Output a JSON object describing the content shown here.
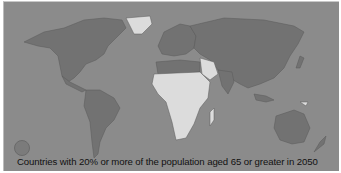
{
  "map": {
    "title": "Countries with 20% or more of the population aged 65 or greater in 2050",
    "legend": {
      "symbol": "filled-circle",
      "color": "#7a7a7a"
    },
    "colors": {
      "ocean": "#8b8b8b",
      "highlighted_land": "#727272",
      "other_land": "#dcdcdc",
      "border": "#555555"
    },
    "highlighted_regions": [
      "North America",
      "South America",
      "Europe",
      "Russia",
      "Asia",
      "Australia",
      "North Africa"
    ],
    "non_highlighted_regions": [
      "Greenland",
      "Sub-Saharan Africa",
      "Arabian Peninsula",
      "Central Asia",
      "Papua New Guinea"
    ]
  }
}
